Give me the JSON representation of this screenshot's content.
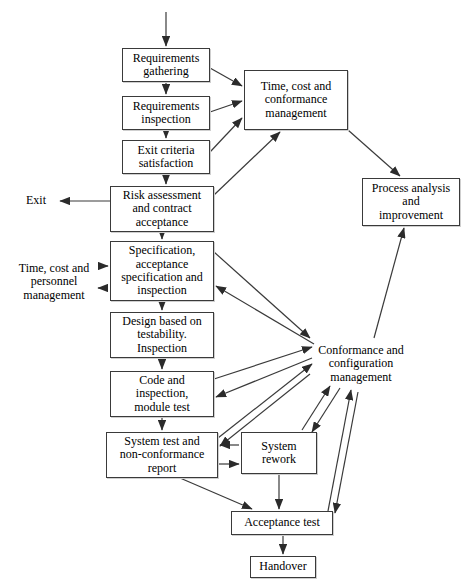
{
  "diagram": {
    "type": "flowchart",
    "canvas": {
      "width": 472,
      "height": 588
    },
    "stroke_color": "#3a3a3a",
    "text_color": "#000000",
    "background_color": "#ffffff"
  },
  "nodes": [
    {
      "id": "requirements-gathering",
      "label": "Requirements\ngathering",
      "boxed": true,
      "x": 122,
      "y": 48,
      "w": 88,
      "h": 34,
      "font_size": 12
    },
    {
      "id": "requirements-inspection",
      "label": "Requirements\ninspection",
      "boxed": true,
      "x": 122,
      "y": 96,
      "w": 88,
      "h": 34,
      "font_size": 12
    },
    {
      "id": "exit-criteria-satisfaction",
      "label": "Exit criteria\nsatisfaction",
      "boxed": true,
      "x": 122,
      "y": 140,
      "w": 88,
      "h": 34,
      "font_size": 12
    },
    {
      "id": "risk-assessment-and-contract-acceptance",
      "label": "Risk assessment\nand contract\nacceptance",
      "boxed": true,
      "x": 110,
      "y": 186,
      "w": 104,
      "h": 46,
      "font_size": 12
    },
    {
      "id": "specification-acceptance-specification-and-inspection",
      "label": "Specification,\nacceptance\nspecification and\ninspection",
      "boxed": true,
      "x": 110,
      "y": 241,
      "w": 104,
      "h": 60,
      "font_size": 12
    },
    {
      "id": "design-based-on-testability-inspection",
      "label": "Design based on\ntestability.\nInspection",
      "boxed": true,
      "x": 110,
      "y": 312,
      "w": 104,
      "h": 46,
      "font_size": 12
    },
    {
      "id": "code-and-inspection-module-test",
      "label": "Code and\ninspection,\nmodule test",
      "boxed": true,
      "x": 110,
      "y": 371,
      "w": 104,
      "h": 46,
      "font_size": 12
    },
    {
      "id": "system-test-and-non-conformance-report",
      "label": "System test and\nnon-conformance\nreport",
      "boxed": true,
      "x": 106,
      "y": 432,
      "w": 112,
      "h": 46,
      "font_size": 12
    },
    {
      "id": "system-rework",
      "label": "System\nrework",
      "boxed": true,
      "x": 241,
      "y": 432,
      "w": 76,
      "h": 42,
      "font_size": 12
    },
    {
      "id": "acceptance-test",
      "label": "Acceptance test",
      "boxed": true,
      "x": 231,
      "y": 511,
      "w": 102,
      "h": 24,
      "font_size": 12
    },
    {
      "id": "handover",
      "label": "Handover",
      "boxed": true,
      "x": 250,
      "y": 556,
      "w": 66,
      "h": 22,
      "font_size": 12
    },
    {
      "id": "time-cost-and-conformance-management",
      "label": "Time, cost and\nconformance\nmanagement",
      "boxed": true,
      "x": 244,
      "y": 70,
      "w": 104,
      "h": 60,
      "font_size": 12
    },
    {
      "id": "process-analysis-and-improvement",
      "label": "Process analysis\nand\nimprovement",
      "boxed": true,
      "x": 362,
      "y": 178,
      "w": 98,
      "h": 48,
      "font_size": 12
    },
    {
      "id": "conformance-and-configuration-management",
      "label": "Conformance and\nconfiguration\nmanagement",
      "boxed": false,
      "x": 306,
      "y": 340,
      "w": 110,
      "h": 48,
      "font_size": 12
    },
    {
      "id": "time-cost-and-personnel-management",
      "label": "Time, cost and\npersonnel\nmanagement",
      "boxed": false,
      "x": 8,
      "y": 258,
      "w": 92,
      "h": 48,
      "font_size": 12
    },
    {
      "id": "exit",
      "label": "Exit",
      "boxed": false,
      "x": 18,
      "y": 192,
      "w": 36,
      "h": 18,
      "font_size": 12
    }
  ],
  "edges": [
    {
      "id": "entry-to-requirements-gathering",
      "from": "external-entry",
      "to": "requirements-gathering",
      "points": "166,12 166,46",
      "arrow_end": true
    },
    {
      "id": "requirements-gathering-to-requirements-inspection",
      "from": "requirements-gathering",
      "to": "requirements-inspection",
      "points": "166,82 166,94",
      "arrow_end": true
    },
    {
      "id": "requirements-inspection-to-exit-criteria",
      "from": "requirements-inspection",
      "to": "exit-criteria-satisfaction",
      "points": "166,130 166,138",
      "arrow_end": true
    },
    {
      "id": "exit-criteria-to-risk-assessment",
      "from": "exit-criteria-satisfaction",
      "to": "risk-assessment-and-contract-acceptance",
      "points": "166,174 166,184",
      "arrow_end": true
    },
    {
      "id": "risk-assessment-to-specification",
      "from": "risk-assessment-and-contract-acceptance",
      "to": "specification-acceptance-specification-and-inspection",
      "points": "162,232 162,239",
      "arrow_end": true
    },
    {
      "id": "specification-to-design",
      "from": "specification-acceptance-specification-and-inspection",
      "to": "design-based-on-testability-inspection",
      "points": "162,301 162,310",
      "arrow_end": true
    },
    {
      "id": "design-to-code",
      "from": "design-based-on-testability-inspection",
      "to": "code-and-inspection-module-test",
      "points": "162,358 162,369",
      "arrow_end": true
    },
    {
      "id": "code-to-system-test",
      "from": "code-and-inspection-module-test",
      "to": "system-test-and-non-conformance-report",
      "points": "162,417 162,430",
      "arrow_end": true
    },
    {
      "id": "risk-assessment-to-exit",
      "from": "risk-assessment-and-contract-acceptance",
      "to": "exit",
      "points": "110,201 60,201",
      "arrow_end": true
    },
    {
      "id": "requirements-gathering-to-time-cost-conformance",
      "from": "requirements-gathering",
      "to": "time-cost-and-conformance-management",
      "points": "210,68 242,86",
      "arrow_end": true
    },
    {
      "id": "requirements-inspection-to-time-cost-conformance",
      "from": "requirements-inspection",
      "to": "time-cost-and-conformance-management",
      "points": "210,112 242,101",
      "arrow_end": true
    },
    {
      "id": "exit-criteria-to-time-cost-conformance",
      "from": "exit-criteria-satisfaction",
      "to": "time-cost-and-conformance-management",
      "points": "210,152 242,118",
      "arrow_end": true
    },
    {
      "id": "risk-assessment-to-time-cost-conformance",
      "from": "risk-assessment-and-contract-acceptance",
      "to": "time-cost-and-conformance-management",
      "points": "214,195 280,132",
      "arrow_end": true
    },
    {
      "id": "time-cost-conformance-to-process-analysis",
      "from": "time-cost-and-conformance-management",
      "to": "process-analysis-and-improvement",
      "points": "348,130 400,176",
      "arrow_end": true
    },
    {
      "id": "conformance-config-to-process-analysis",
      "from": "conformance-and-configuration-management",
      "to": "process-analysis-and-improvement",
      "points": "374,338 404,228",
      "arrow_end": true
    },
    {
      "id": "personnel-mgmt-to-specification",
      "from": "time-cost-and-personnel-management",
      "to": "specification-acceptance-specification-and-inspection",
      "points": "100,266 108,266",
      "arrow_end": true
    },
    {
      "id": "specification-to-personnel-mgmt",
      "from": "specification-acceptance-specification-and-inspection",
      "to": "time-cost-and-personnel-management",
      "points": "108,288 98,288",
      "arrow_end": true
    },
    {
      "id": "specification-to-conformance-config",
      "from": "specification-acceptance-specification-and-inspection",
      "to": "conformance-and-configuration-management",
      "points": "214,252 310,338",
      "arrow_end": true
    },
    {
      "id": "conformance-config-to-specification",
      "from": "conformance-and-configuration-management",
      "to": "specification-acceptance-specification-and-inspection",
      "points": "314,344 216,286",
      "arrow_end": true
    },
    {
      "id": "code-to-conformance-config",
      "from": "code-and-inspection-module-test",
      "to": "conformance-and-configuration-management",
      "points": "214,379 312,347",
      "arrow_end": true
    },
    {
      "id": "conformance-config-to-code",
      "from": "conformance-and-configuration-management",
      "to": "code-and-inspection-module-test",
      "points": "312,358 216,397",
      "arrow_end": true
    },
    {
      "id": "system-test-to-conformance-config",
      "from": "system-test-and-non-conformance-report",
      "to": "conformance-and-configuration-management",
      "points": "218,438 312,364",
      "arrow_end": true
    },
    {
      "id": "conformance-config-to-system-test",
      "from": "conformance-and-configuration-management",
      "to": "system-test-and-non-conformance-report",
      "points": "310,374 220,446",
      "arrow_end": true
    },
    {
      "id": "system-rework-to-conformance-config",
      "from": "system-rework",
      "to": "conformance-and-configuration-management",
      "points": "302,430 330,386",
      "arrow_end": true
    },
    {
      "id": "conformance-config-to-system-rework",
      "from": "conformance-and-configuration-management",
      "to": "system-rework",
      "points": "340,388 312,432",
      "arrow_end": true
    },
    {
      "id": "system-rework-to-system-test",
      "from": "system-rework",
      "to": "system-test-and-non-conformance-report",
      "points": "239,445 220,445",
      "arrow_end": true
    },
    {
      "id": "system-test-to-system-rework",
      "from": "system-test-and-non-conformance-report",
      "to": "system-rework",
      "points": "218,464 239,464",
      "arrow_end": true
    },
    {
      "id": "system-test-to-acceptance-test",
      "from": "system-test-and-non-conformance-report",
      "to": "acceptance-test",
      "points": "180,478 252,509",
      "arrow_end": true
    },
    {
      "id": "system-rework-to-acceptance-test",
      "from": "system-rework",
      "to": "acceptance-test",
      "points": "279,474 279,509",
      "arrow_end": true
    },
    {
      "id": "acceptance-test-to-conformance-config",
      "from": "acceptance-test",
      "to": "conformance-and-configuration-management",
      "points": "328,511 351,390",
      "arrow_end": true
    },
    {
      "id": "conformance-config-to-acceptance-test",
      "from": "conformance-and-configuration-management",
      "to": "acceptance-test",
      "points": "358,392 335,513",
      "arrow_end": true
    },
    {
      "id": "acceptance-test-to-handover",
      "from": "acceptance-test",
      "to": "handover",
      "points": "283,535 283,554",
      "arrow_end": true
    }
  ]
}
